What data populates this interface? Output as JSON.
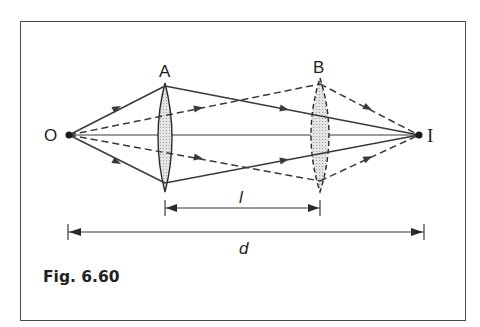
{
  "figure": {
    "caption": "Fig. 6.60",
    "points": {
      "object": {
        "label": "O",
        "x": 69,
        "y": 135
      },
      "image": {
        "label": "I",
        "x": 419,
        "y": 135
      }
    },
    "lenses": [
      {
        "label": "A",
        "x": 165,
        "top": 83,
        "bottom": 192,
        "half_width": 7,
        "style": "solid"
      },
      {
        "label": "B",
        "x": 320,
        "top": 78,
        "bottom": 192,
        "half_width": 9,
        "style": "dashed"
      }
    ],
    "dimensions": {
      "l": {
        "label": "l",
        "x1": 165,
        "x2": 320,
        "y": 208
      },
      "d": {
        "label": "d",
        "x1": 68,
        "x2": 424,
        "y": 232
      }
    },
    "rays": {
      "solid": [
        {
          "from": "O",
          "via": [
            165,
            86
          ],
          "to": "I"
        },
        {
          "from": "O",
          "via": [
            165,
            183
          ],
          "to": "I"
        }
      ],
      "dashed": [
        {
          "from": "O",
          "via": [
            320,
            84
          ],
          "to": "I"
        },
        {
          "from": "O",
          "via": [
            320,
            181
          ],
          "to": "I"
        }
      ],
      "axis": {
        "from": "O",
        "to": "I"
      }
    },
    "colors": {
      "line": "#3a3a3a",
      "lens_fill": "#d9d9d9",
      "frame": "#4a4a4a"
    }
  }
}
